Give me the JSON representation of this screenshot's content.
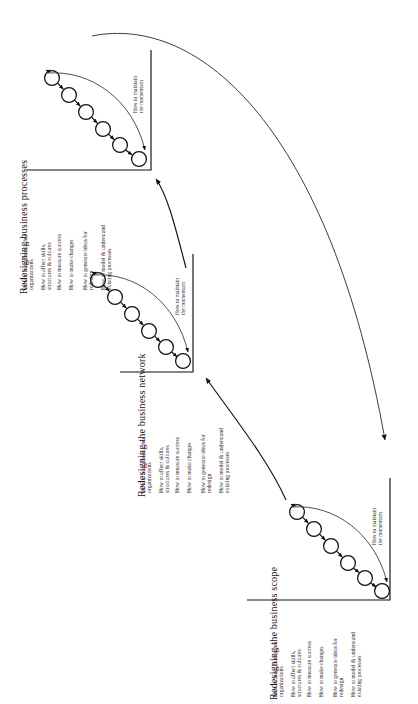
{
  "diagram": {
    "title_text_orientation": "rotated-90-ccw",
    "ink_color": "#1a1a1a",
    "background_color": "#ffffff",
    "momentum_label": {
      "line1": "How to maintain",
      "line2": "the momentum"
    },
    "axis_labels": [
      {
        "line1": "How to learn from other",
        "line2": "organizations"
      },
      {
        "line1": "How to affect skills,",
        "line2": "structures & cultures"
      },
      {
        "line1": "How to measure success",
        "line2": ""
      },
      {
        "line1": "How to make changes",
        "line2": ""
      },
      {
        "line1": "How to generate ideas for",
        "line2": "redesign"
      },
      {
        "line1": "How to model & understand",
        "line2": "existing processes"
      }
    ],
    "stages": [
      {
        "id": "business-processes",
        "title": "Redesigning business processes",
        "node_count": 6
      },
      {
        "id": "business-network",
        "title": "Redesigning the business network",
        "node_count": 6
      },
      {
        "id": "business-scope",
        "title": "Redesigning the business scope",
        "node_count": 6
      }
    ]
  }
}
